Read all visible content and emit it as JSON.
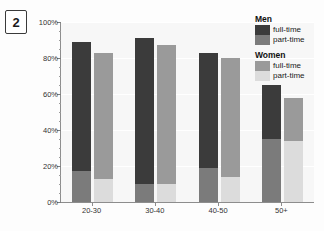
{
  "figure": {
    "badge_number": "2"
  },
  "legend": {
    "groups": [
      {
        "title": "Men",
        "entries": [
          {
            "label": "full-time",
            "color": "#3b3b3b"
          },
          {
            "label": "part-time",
            "color": "#7b7b7b"
          }
        ]
      },
      {
        "title": "Women",
        "entries": [
          {
            "label": "full-time",
            "color": "#9a9a9a"
          },
          {
            "label": "part-time",
            "color": "#dcdcdc"
          }
        ]
      }
    ]
  },
  "chart_data": {
    "type": "bar",
    "title": "",
    "xlabel": "",
    "ylabel": "",
    "ylim": [
      0,
      100
    ],
    "ytick_labels": [
      "0%",
      "20%",
      "40%",
      "60%",
      "80%",
      "100%"
    ],
    "ytick_values": [
      0,
      20,
      40,
      60,
      80,
      100
    ],
    "grid": true,
    "stacked": true,
    "legend_position": "top-right",
    "categories": [
      "20-30",
      "30-40",
      "40-50",
      "50+"
    ],
    "series": [
      {
        "name": "Men full-time",
        "color": "#3b3b3b",
        "values": [
          72,
          81,
          64,
          30
        ]
      },
      {
        "name": "Men part-time",
        "color": "#7b7b7b",
        "values": [
          17,
          10,
          19,
          35
        ]
      },
      {
        "name": "Women full-time",
        "color": "#9a9a9a",
        "values": [
          70,
          77,
          66,
          24
        ]
      },
      {
        "name": "Women part-time",
        "color": "#dcdcdc",
        "values": [
          13,
          10,
          14,
          34
        ]
      }
    ],
    "stack_totals": {
      "men": [
        89,
        91,
        83,
        65
      ],
      "women": [
        83,
        87,
        80,
        58
      ]
    }
  }
}
